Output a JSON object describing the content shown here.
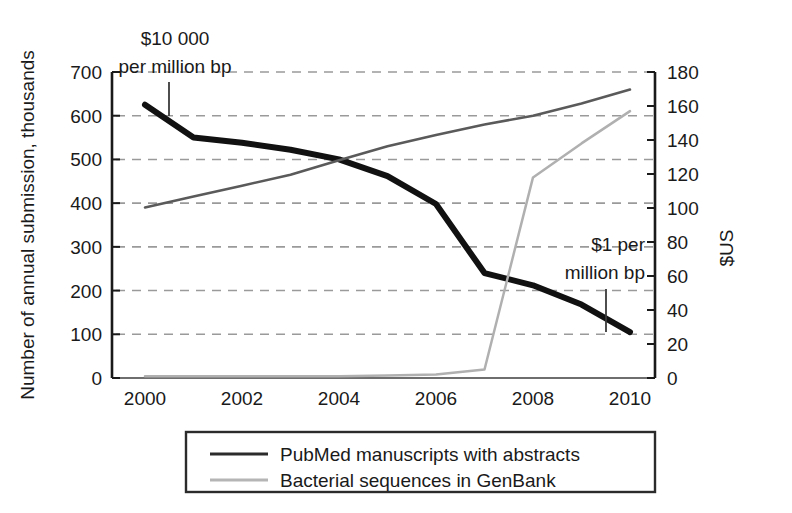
{
  "chart_data": {
    "type": "line",
    "title": "",
    "subtitle": "",
    "xlabel": "",
    "ylabel": "Number of annual submission, thousands",
    "y2label": "$US",
    "x": [
      2000,
      2001,
      2002,
      2003,
      2004,
      2005,
      2006,
      2007,
      2008,
      2009,
      2010
    ],
    "xlim": [
      2000,
      2010
    ],
    "ylim": [
      0,
      700
    ],
    "y2lim": [
      0,
      180
    ],
    "grid": "horizontal-dashed",
    "legend_position": "bottom-center",
    "xticks": [
      "2000",
      "2002",
      "2004",
      "2006",
      "2008",
      "2010"
    ],
    "xtick_values": [
      2000,
      2002,
      2004,
      2006,
      2008,
      2010
    ],
    "yticks": [
      "0",
      "100",
      "200",
      "300",
      "400",
      "500",
      "600",
      "700"
    ],
    "ytick_values": [
      0,
      100,
      200,
      300,
      400,
      500,
      600,
      700
    ],
    "y2ticks": [
      "0",
      "20",
      "40",
      "60",
      "80",
      "100",
      "120",
      "140",
      "160",
      "180"
    ],
    "y2tick_values": [
      0,
      20,
      40,
      60,
      80,
      100,
      120,
      140,
      160,
      180
    ],
    "series": [
      {
        "name": "PubMed manuscripts with abstracts",
        "axis": "left",
        "color": "#111111",
        "width": 6,
        "values": [
          625,
          550,
          538,
          522,
          500,
          462,
          398,
          240,
          212,
          168,
          105
        ]
      },
      {
        "name": "Bacterial sequences in GenBank",
        "axis": "left",
        "color": "#5a5a5a",
        "width": 2.5,
        "values": [
          390,
          415,
          440,
          465,
          498,
          530,
          556,
          580,
          600,
          628,
          660
        ]
      },
      {
        "name": "Sequencing cost",
        "axis": "right",
        "color": "#b0b0b0",
        "width": 2.5,
        "values": [
          1,
          1,
          1,
          1,
          1,
          1.5,
          2,
          5,
          118,
          138,
          157
        ]
      }
    ],
    "annotations": [
      {
        "id": "cost-high",
        "line1": "$10 000",
        "line2": "per million bp",
        "text_anchor": "middle",
        "text_x": 175,
        "text_y1": 45,
        "text_y2": 73,
        "pointer_x": 169,
        "pointer_y1": 82,
        "pointer_y2": 116
      },
      {
        "id": "cost-low",
        "line1": "$1 per",
        "line2": "million bp",
        "text_anchor": "end",
        "text_x": 645,
        "text_y1": 251,
        "text_y2": 279,
        "pointer_x": 606,
        "pointer_y1": 289,
        "pointer_y2": 332
      }
    ],
    "legend": [
      {
        "label": "PubMed manuscripts with abstracts",
        "color": "#2b2b2b",
        "width": 3
      },
      {
        "label": "Bacterial sequences in GenBank",
        "color": "#b5b5b5",
        "width": 3
      }
    ]
  },
  "colors": {
    "axis": "#1a1a1a",
    "grid": "#9a9a9a",
    "background": "#ffffff",
    "pubmed": "#111111",
    "genbank_dark": "#5a5a5a",
    "cost_light": "#b0b0b0",
    "legend_border": "#2b2b2b"
  },
  "geometry": {
    "plot_left": 112,
    "plot_right": 655,
    "plot_top": 72,
    "plot_bottom": 378,
    "x_first": 145,
    "x_last": 630,
    "legend_box": {
      "x": 186,
      "y": 432,
      "w": 469,
      "h": 60
    }
  }
}
